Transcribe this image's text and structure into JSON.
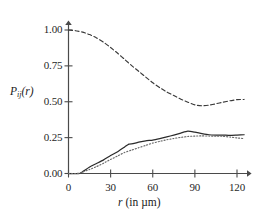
{
  "chart_data": {
    "type": "line",
    "title": "",
    "xlabel": "r (in µm)",
    "ylabel": "P_ij(r)",
    "xlabel_symbol": "r",
    "xlabel_units": "(in µm)",
    "ylabel_base": "P",
    "ylabel_sub": "ij",
    "ylabel_arg": "(r)",
    "xlim": [
      0,
      128
    ],
    "ylim": [
      0.0,
      1.06
    ],
    "grid": false,
    "legend": "none",
    "xticks": [
      0,
      30,
      60,
      90,
      120
    ],
    "xtick_labels": [
      "0",
      "30",
      "60",
      "90",
      "120"
    ],
    "yticks": [
      0.0,
      0.25,
      0.5,
      0.75,
      1.0
    ],
    "ytick_labels": [
      "0.00",
      "0.25",
      "0.50",
      "0.75",
      "1.00"
    ],
    "axis_color": "#4a4a4a",
    "series": [
      {
        "name": "dashed-upper-curve",
        "style": "dashed",
        "color": "#3a3a3a",
        "x": [
          0,
          5,
          10,
          15,
          20,
          25,
          30,
          35,
          40,
          45,
          50,
          55,
          60,
          65,
          70,
          75,
          80,
          85,
          90,
          95,
          100,
          105,
          110,
          115,
          120,
          125
        ],
        "y": [
          1.0,
          0.995,
          0.985,
          0.968,
          0.945,
          0.915,
          0.878,
          0.838,
          0.795,
          0.752,
          0.712,
          0.672,
          0.632,
          0.598,
          0.568,
          0.543,
          0.518,
          0.497,
          0.478,
          0.472,
          0.476,
          0.486,
          0.497,
          0.507,
          0.515,
          0.516
        ]
      },
      {
        "name": "solid-middle-curve",
        "style": "solid",
        "color": "#2b2b2b",
        "x": [
          0,
          5,
          8,
          10,
          15,
          20,
          25,
          30,
          35,
          40,
          43,
          46,
          50,
          55,
          60,
          65,
          70,
          75,
          80,
          85,
          90,
          95,
          100,
          105,
          110,
          115,
          120,
          125
        ],
        "y": [
          0.0,
          0.0,
          0.0,
          0.012,
          0.045,
          0.07,
          0.095,
          0.125,
          0.152,
          0.185,
          0.205,
          0.208,
          0.218,
          0.228,
          0.233,
          0.243,
          0.255,
          0.268,
          0.282,
          0.295,
          0.288,
          0.278,
          0.27,
          0.268,
          0.268,
          0.266,
          0.268,
          0.27
        ]
      },
      {
        "name": "dotted-lower-curve",
        "style": "dotted",
        "color": "#6a6a6a",
        "x": [
          0,
          5,
          8,
          10,
          15,
          20,
          25,
          30,
          35,
          40,
          45,
          50,
          55,
          60,
          65,
          70,
          75,
          80,
          85,
          90,
          95,
          100,
          105,
          110,
          115,
          120,
          125
        ],
        "y": [
          0.0,
          0.0,
          0.002,
          0.01,
          0.028,
          0.048,
          0.072,
          0.098,
          0.122,
          0.147,
          0.163,
          0.18,
          0.196,
          0.212,
          0.224,
          0.235,
          0.244,
          0.252,
          0.258,
          0.261,
          0.262,
          0.261,
          0.26,
          0.259,
          0.254,
          0.248,
          0.243
        ]
      }
    ]
  }
}
